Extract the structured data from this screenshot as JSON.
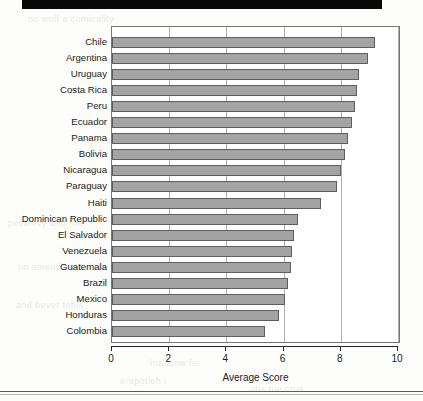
{
  "page": {
    "top_rule": "black-bar",
    "ghost_text": [
      "no wolf a comicality",
      "pecanivy and the",
      "no amendment then",
      "and bever tohis",
      "ina lonw fer",
      "erapotieh i",
      "utis tue crus"
    ]
  },
  "chart_data": {
    "type": "bar",
    "orientation": "horizontal",
    "title": "",
    "xlabel": "Average Score",
    "ylabel": "",
    "xlim": [
      0,
      10
    ],
    "xticks": [
      "0",
      "2",
      "4",
      "6",
      "8",
      "10"
    ],
    "xtick_values": [
      0,
      2,
      4,
      6,
      8,
      10
    ],
    "grid": true,
    "grid_axis": "x",
    "legend": "none",
    "bar_color": "#a3a3a3",
    "bar_edge_color": "#5e5e5e",
    "categories": [
      "Chile",
      "Argentina",
      "Uruguay",
      "Costa Rica",
      "Peru",
      "Ecuador",
      "Panama",
      "Bolivia",
      "Nicaragua",
      "Paraguay",
      "Haiti",
      "Dominican Republic",
      "El Salvador",
      "Venezuela",
      "Guatemala",
      "Brazil",
      "Mexico",
      "Honduras",
      "Colombia"
    ],
    "values": [
      9.2,
      8.95,
      8.65,
      8.55,
      8.5,
      8.4,
      8.25,
      8.15,
      8.0,
      7.85,
      7.3,
      6.5,
      6.35,
      6.3,
      6.25,
      6.15,
      6.05,
      5.85,
      5.35
    ]
  }
}
